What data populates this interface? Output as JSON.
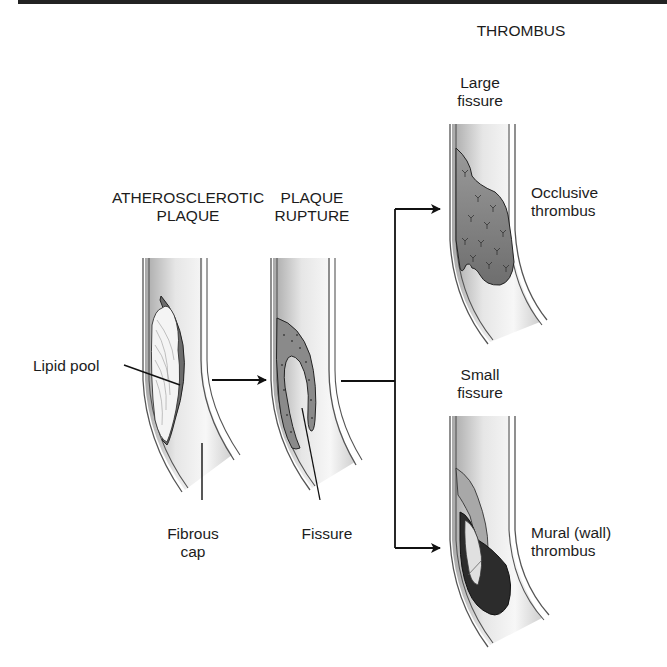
{
  "figure": {
    "title": "THROMBUS",
    "stages": [
      {
        "id": "atherosclerotic-plaque",
        "heading_line1": "ATHEROSCLEROTIC",
        "heading_line2": "PLAQUE",
        "annotations": [
          {
            "id": "lipid-pool",
            "text": "Lipid pool"
          },
          {
            "id": "fibrous-cap",
            "line1": "Fibrous",
            "line2": "cap"
          }
        ]
      },
      {
        "id": "plaque-rupture",
        "heading_line1": "PLAQUE",
        "heading_line2": "RUPTURE",
        "annotations": [
          {
            "id": "fissure",
            "text": "Fissure"
          }
        ]
      },
      {
        "id": "occlusive-thrombus",
        "heading_line1": "Large",
        "heading_line2": "fissure",
        "result_line1": "Occlusive",
        "result_line2": "thrombus"
      },
      {
        "id": "mural-thrombus",
        "heading_line1": "Small",
        "heading_line2": "fissure",
        "result_line1": "Mural (wall)",
        "result_line2": "thrombus"
      }
    ],
    "colors": {
      "vessel_wall": "#555555",
      "lumen_shade": "#bdbdbd",
      "plaque_fill": "#8a8a8a",
      "thrombus_fill": "#7a7a7a",
      "mural_dark": "#2a2a2a",
      "arrow": "#111111"
    }
  }
}
